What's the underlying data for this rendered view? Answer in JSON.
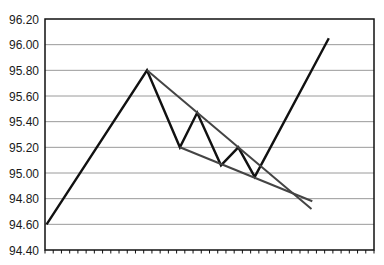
{
  "chart_data": {
    "type": "line",
    "title": "",
    "xlabel": "",
    "ylabel": "",
    "ylim": [
      94.4,
      96.2
    ],
    "y_ticks": [
      "94.40",
      "94.60",
      "94.80",
      "95.00",
      "95.20",
      "95.40",
      "95.60",
      "95.80",
      "96.00",
      "96.20"
    ],
    "x_tick_count": 40,
    "x_tick_labels": [],
    "grid": {
      "horizontal": true,
      "vertical": false
    },
    "legend": null,
    "series": [
      {
        "name": "Price",
        "color": "#111111",
        "x": [
          0.2,
          12.4,
          16.4,
          18.5,
          21.4,
          23.5,
          25.5,
          34.5
        ],
        "values": [
          94.6,
          95.8,
          95.2,
          95.47,
          95.06,
          95.2,
          94.97,
          96.05
        ]
      },
      {
        "name": "Upper trendline (resistance)",
        "color": "#444444",
        "x": [
          12.4,
          32.4
        ],
        "values": [
          95.8,
          94.72
        ]
      },
      {
        "name": "Lower trendline (support)",
        "color": "#444444",
        "x": [
          16.4,
          32.5
        ],
        "values": [
          95.2,
          94.78
        ]
      }
    ],
    "annotations": [
      "Falling wedge / descending pennant pattern with upward breakout"
    ]
  },
  "colors": {
    "background": "#ffffff",
    "axis": "#111111",
    "grid": "#9a9a9a",
    "price_line": "#111111",
    "trendline": "#444444"
  }
}
